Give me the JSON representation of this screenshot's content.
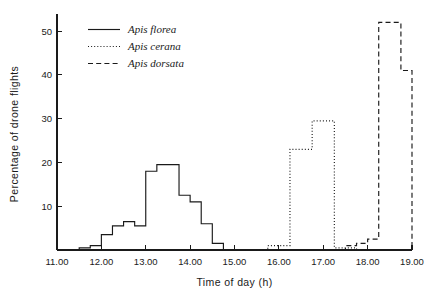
{
  "chart_data": {
    "type": "line",
    "title": "",
    "xlabel": "Time of day  (h)",
    "ylabel": "Percentage of drone flights",
    "xlim": [
      11.0,
      19.0
    ],
    "ylim": [
      0,
      53
    ],
    "grid": false,
    "legend_position": "top-left",
    "xticks": [
      11.0,
      12.0,
      13.0,
      14.0,
      15.0,
      16.0,
      17.0,
      18.0,
      19.0
    ],
    "xticklabels": [
      "11.00",
      "12.00",
      "13.00",
      "14.00",
      "15.00",
      "16.00",
      "17.00",
      "18.00",
      "19.00"
    ],
    "yticks": [
      10,
      20,
      30,
      40,
      50
    ],
    "yticklabels": [
      "10",
      "20",
      "30",
      "40",
      "50"
    ],
    "step_width": 0.25,
    "series": [
      {
        "name": "Apis florea",
        "style": "solid",
        "x": [
          11.0,
          11.25,
          11.5,
          11.75,
          12.0,
          12.25,
          12.5,
          12.75,
          13.0,
          13.25,
          13.5,
          13.75,
          14.0,
          14.25,
          14.5,
          14.75,
          15.0
        ],
        "values": [
          0,
          0,
          0.5,
          1.0,
          3.5,
          5.5,
          6.5,
          5.5,
          18.0,
          19.5,
          19.5,
          12.5,
          11.0,
          6.0,
          1.5,
          0,
          0
        ]
      },
      {
        "name": "Apis cerana",
        "style": "dotted",
        "x": [
          15.5,
          15.75,
          16.0,
          16.25,
          16.5,
          16.75,
          17.0,
          17.25,
          17.5,
          17.75
        ],
        "values": [
          0,
          1.0,
          1.0,
          23.0,
          23.0,
          29.5,
          29.5,
          0.5,
          0.5,
          0
        ]
      },
      {
        "name": "Apis dorsata",
        "style": "dashed",
        "x": [
          17.25,
          17.5,
          17.75,
          18.0,
          18.25,
          18.5,
          18.75,
          19.0
        ],
        "values": [
          0,
          1.0,
          1.5,
          2.5,
          52.0,
          52.0,
          41.0,
          0
        ]
      }
    ]
  },
  "legend": {
    "items": [
      {
        "label": "Apis florea",
        "style": "solid"
      },
      {
        "label": "Apis cerana",
        "style": "dotted"
      },
      {
        "label": "Apis dorsata",
        "style": "dashed"
      }
    ]
  }
}
